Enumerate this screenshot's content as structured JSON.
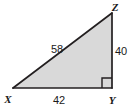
{
  "figure": {
    "kind": "right-triangle-diagram",
    "name": "Right triangle XYZ",
    "background_color": "#ffffff",
    "fill_color": "#d9d9d9",
    "stroke_color": "#231f20",
    "stroke_width": 1.6,
    "vertices": [
      {
        "id": "X",
        "label": "X",
        "x": 13,
        "y": 88,
        "label_x": 8,
        "label_y": 101
      },
      {
        "id": "Y",
        "label": "Y",
        "x": 112,
        "y": 88,
        "label_x": 108,
        "label_y": 102
      },
      {
        "id": "Z",
        "label": "Z",
        "x": 112,
        "y": 13,
        "label_x": 111,
        "label_y": 11
      }
    ],
    "sides": [
      {
        "id": "hypotenuse-XZ",
        "label": "58",
        "from": "X",
        "to": "Z",
        "label_x": 50,
        "label_y": 52
      },
      {
        "id": "leg-ZY",
        "label": "40",
        "from": "Z",
        "to": "Y",
        "label_x": 116,
        "label_y": 55
      },
      {
        "id": "leg-XY",
        "label": "42",
        "from": "X",
        "to": "Y",
        "label_x": 52,
        "label_y": 103
      }
    ],
    "right_angle": {
      "at_vertex": "Y",
      "marker": "square",
      "size": 10,
      "marker_x": 102,
      "marker_y": 78
    }
  }
}
